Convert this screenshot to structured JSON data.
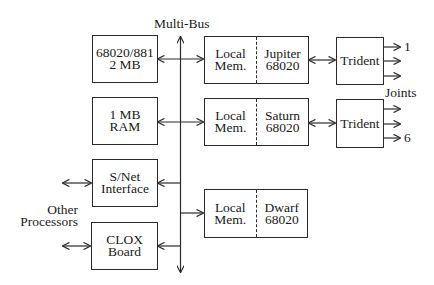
{
  "diagram": {
    "bus_label": "Multi-Bus",
    "left_boxes": [
      {
        "id": "cpu",
        "lines": [
          "68020/881",
          "2 MB"
        ]
      },
      {
        "id": "ram",
        "lines": [
          "1 MB",
          "RAM"
        ]
      },
      {
        "id": "snet",
        "lines": [
          "S/Net",
          "Interface"
        ]
      },
      {
        "id": "clox",
        "lines": [
          "CLOX",
          "Board"
        ]
      }
    ],
    "processor_boxes": [
      {
        "id": "jupiter",
        "mem": [
          "Local",
          "Mem."
        ],
        "cpu": [
          "Jupiter",
          "68020"
        ]
      },
      {
        "id": "saturn",
        "mem": [
          "Local",
          "Mem."
        ],
        "cpu": [
          "Saturn",
          "68020"
        ]
      },
      {
        "id": "dwarf",
        "mem": [
          "Local",
          "Mem."
        ],
        "cpu": [
          "Dwarf",
          "68020"
        ]
      }
    ],
    "trident_boxes": [
      {
        "id": "trident1",
        "label": "Trident"
      },
      {
        "id": "trident2",
        "label": "Trident"
      }
    ],
    "joint_labels": {
      "first": "1",
      "last": "6",
      "caption": "Joints"
    },
    "other_processors_label": [
      "Other",
      "Processors"
    ]
  }
}
